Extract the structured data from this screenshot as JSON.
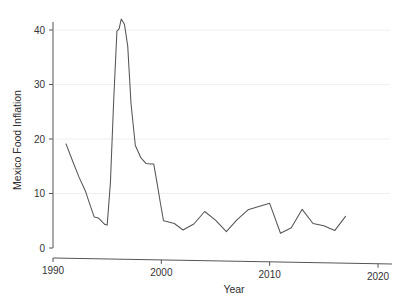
{
  "chart_data": {
    "type": "line",
    "title": "",
    "subtitle": "",
    "xlabel": "Year",
    "ylabel": "Mexico Food Inflation",
    "xlim": [
      1990,
      2020
    ],
    "ylim": [
      0,
      43
    ],
    "grid": true,
    "grid_axis": "y",
    "legend": false,
    "legend_position": "none",
    "line_color": "#555555",
    "background_color": "#ffffff",
    "xticks": [
      1990,
      2000,
      2010,
      2020
    ],
    "xticklabels": [
      "1990",
      "2000",
      "2010",
      "2020"
    ],
    "yticks": [
      0,
      10,
      20,
      30,
      40
    ],
    "yticklabels": [
      "0",
      "10",
      "20",
      "30",
      "40"
    ],
    "series": [
      {
        "name": "Mexico Food Inflation",
        "x": [
          1991.2,
          1991.8,
          1992.4,
          1993.0,
          1993.4,
          1993.8,
          1994.2,
          1994.5,
          1994.8,
          1995.0,
          1995.3,
          1995.6,
          1995.9,
          1996.1,
          1996.3,
          1996.6,
          1996.9,
          1997.2,
          1997.6,
          1998.1,
          1998.6,
          1999.0,
          1999.3,
          1999.6,
          1999.9,
          2000.2,
          2000.6,
          2001.2,
          2002.0,
          2003.0,
          2004.0,
          2005.0,
          2006.0,
          2007.0,
          2008.0,
          2009.0,
          2010.0,
          2011.0,
          2012.0,
          2013.0,
          2014.0,
          2015.0,
          2016.0,
          2017.0
        ],
        "values": [
          19.1,
          16.0,
          13.0,
          10.4,
          8.0,
          5.7,
          5.5,
          4.9,
          4.3,
          4.2,
          12.0,
          27.0,
          39.8,
          40.2,
          42.0,
          41.0,
          37.0,
          26.5,
          18.8,
          16.6,
          15.5,
          15.4,
          15.4,
          12.0,
          8.4,
          5.0,
          4.8,
          4.5,
          3.3,
          4.4,
          6.7,
          5.1,
          3.0,
          5.2,
          7.0,
          7.6,
          8.2,
          2.7,
          3.7,
          7.1,
          4.5,
          4.1,
          3.2,
          5.8
        ]
      }
    ]
  },
  "chart": {
    "y_axis_label": "Mexico Food Inflation",
    "x_axis_label": "Year"
  }
}
